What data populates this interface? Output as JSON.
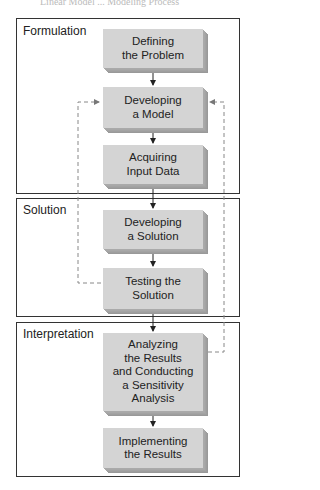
{
  "caption": "Linear Model ... Modeling Process",
  "phases": [
    {
      "id": "formulation",
      "label": "Formulation"
    },
    {
      "id": "solution",
      "label": "Solution"
    },
    {
      "id": "interpretation",
      "label": "Interpretation"
    }
  ],
  "steps": [
    {
      "id": "defining-problem",
      "lines": [
        "Defining",
        "the Problem"
      ],
      "phase": "formulation"
    },
    {
      "id": "developing-model",
      "lines": [
        "Developing",
        "a Model"
      ],
      "phase": "formulation"
    },
    {
      "id": "acquiring-data",
      "lines": [
        "Acquiring",
        "Input Data"
      ],
      "phase": "formulation"
    },
    {
      "id": "developing-solution",
      "lines": [
        "Developing",
        "a Solution"
      ],
      "phase": "solution"
    },
    {
      "id": "testing-solution",
      "lines": [
        "Testing the",
        "Solution"
      ],
      "phase": "solution"
    },
    {
      "id": "analyzing-results",
      "lines": [
        "Analyzing",
        "the Results",
        "and Conducting",
        "a Sensitivity",
        "Analysis"
      ],
      "phase": "interpretation"
    },
    {
      "id": "implementing-results",
      "lines": [
        "Implementing",
        "the Results"
      ],
      "phase": "interpretation"
    }
  ],
  "feedback_loops": [
    {
      "from": "Testing the Solution",
      "to": "Developing a Model",
      "side": "left",
      "style": "dashed"
    },
    {
      "from": "Analyzing the Results and Conducting a Sensitivity Analysis",
      "to": "Developing a Model",
      "side": "right",
      "style": "dashed"
    }
  ],
  "colors": {
    "box_face": "#d4d4d4",
    "box_shadow": "#999999",
    "frame": "#333333",
    "arrow": "#222222",
    "dashed": "#888888"
  }
}
